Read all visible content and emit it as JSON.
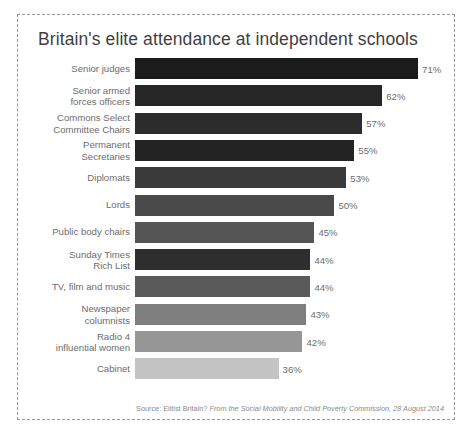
{
  "chart_data": {
    "type": "bar",
    "orientation": "horizontal",
    "title": "Britain's elite attendance at independent schools",
    "xlabel": "",
    "ylabel": "",
    "xlim": [
      0,
      80
    ],
    "grid": false,
    "legend": "none",
    "value_suffix": "%",
    "categories": [
      "Senior judges",
      "Senior armed\nforces officers",
      "Commons Select\nCommittee Chairs",
      "Permanent\nSecretaries",
      "Diplomats",
      "Lords",
      "Public body chairs",
      "Sunday Times\nRich List",
      "TV, film and music",
      "Newspaper\ncolumnists",
      "Radio 4\ninfluential women",
      "Cabinet"
    ],
    "values": [
      71,
      62,
      57,
      55,
      53,
      50,
      45,
      44,
      44,
      43,
      42,
      36
    ],
    "value_labels": [
      "71%",
      "62%",
      "57%",
      "55%",
      "53%",
      "50%",
      "45%",
      "44%",
      "44%",
      "43%",
      "42%",
      "36%"
    ],
    "bar_colors": [
      "#1b1b1b",
      "#262626",
      "#2c2c2c",
      "#232323",
      "#3a3a3a",
      "#4a4a4a",
      "#555555",
      "#2e2e2e",
      "#5a5a5a",
      "#7e7e7e",
      "#969696",
      "#c4c4c4"
    ],
    "source": {
      "prefix": "Source: Elitist Britain? ",
      "italic": "From the Social Mobility and Child Poverty Commission, 28 August 2014"
    }
  },
  "style": {
    "label_color": "#6d6d6d",
    "title_color": "#3f3f3f",
    "border_color": "#9a9a9a",
    "background": "#ffffff"
  }
}
